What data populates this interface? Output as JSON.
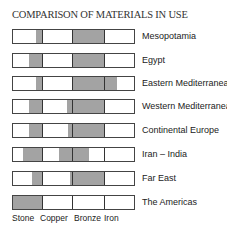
{
  "chart_data": {
    "type": "bar",
    "title": "COMPARISON OF MATERIALS IN USE",
    "categories": [
      "Stone",
      "Copper",
      "Bronze",
      "Iron"
    ],
    "regions": [
      "Mesopotamia",
      "Egypt",
      "Eastern Mediterranean",
      "Western Mediterranean",
      "Continental Europe",
      "Iran – India",
      "Far East",
      "The Americas"
    ],
    "xlabel": "",
    "ylabel": "",
    "legend": "none",
    "note": "Each row is divided into four equal material periods; shaded span indicates extent of use (fraction of each column, 0-1, measured from left).",
    "series": [
      {
        "name": "Mesopotamia",
        "shaded": [
          {
            "from": 0.77,
            "to": 1.0,
            "col": "Stone"
          },
          {
            "from": 0.0,
            "to": 1.0,
            "col": "Bronze"
          }
        ]
      },
      {
        "name": "Egypt",
        "shaded": [
          {
            "from": 0.53,
            "to": 1.0,
            "col": "Stone"
          },
          {
            "from": 0.0,
            "to": 1.0,
            "col": "Bronze"
          }
        ]
      },
      {
        "name": "Eastern Mediterranean",
        "shaded": [
          {
            "from": 0.77,
            "to": 1.0,
            "col": "Stone"
          },
          {
            "from": 0.0,
            "to": 1.0,
            "col": "Bronze"
          },
          {
            "from": 0.0,
            "to": 0.39,
            "col": "Iron"
          }
        ]
      },
      {
        "name": "Western Mediterranean",
        "shaded": [
          {
            "from": 0.53,
            "to": 1.0,
            "col": "Stone"
          },
          {
            "from": 0.8,
            "to": 1.0,
            "col": "Copper"
          },
          {
            "from": 0.0,
            "to": 1.0,
            "col": "Bronze"
          }
        ]
      },
      {
        "name": "Continental Europe",
        "shaded": [
          {
            "from": 0.53,
            "to": 1.0,
            "col": "Stone"
          },
          {
            "from": 0.83,
            "to": 1.0,
            "col": "Copper"
          },
          {
            "from": 0.0,
            "to": 1.0,
            "col": "Bronze"
          }
        ]
      },
      {
        "name": "Iran – India",
        "shaded": [
          {
            "from": 0.33,
            "to": 1.0,
            "col": "Stone"
          },
          {
            "from": 0.53,
            "to": 1.0,
            "col": "Copper"
          },
          {
            "from": 0.0,
            "to": 0.5,
            "col": "Bronze"
          }
        ]
      },
      {
        "name": "Far East",
        "shaded": [
          {
            "from": 0.63,
            "to": 1.0,
            "col": "Stone"
          },
          {
            "from": 0.9,
            "to": 1.0,
            "col": "Copper"
          },
          {
            "from": 0.0,
            "to": 1.0,
            "col": "Bronze"
          }
        ]
      },
      {
        "name": "The Americas",
        "shaded": [
          {
            "from": 0.0,
            "to": 1.0,
            "col": "Stone"
          }
        ]
      }
    ]
  },
  "title": "COMPARISON OF MATERIALS IN USE",
  "rows": [
    {
      "label": "Mesopotamia"
    },
    {
      "label": "Egypt"
    },
    {
      "label": "Eastern Mediterranean"
    },
    {
      "label": "Western Mediterranean"
    },
    {
      "label": "Continental Europe"
    },
    {
      "label": "Iran – India"
    },
    {
      "label": "Far East"
    },
    {
      "label": "The Americas"
    }
  ],
  "x_labels": [
    "Stone",
    "Copper",
    "Bronze",
    "Iron"
  ],
  "colors": {
    "shade": "#a3a3a3",
    "border": "#444444"
  }
}
